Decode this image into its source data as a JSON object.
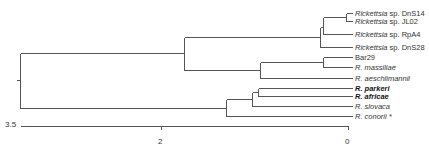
{
  "figure": {
    "type": "phylogenetic-tree",
    "line_color": "#555555",
    "leaves": [
      {
        "id": "DnS14",
        "genus": "Rickettsia",
        "rest": " sp. DnS14",
        "y": 13,
        "x_end": 352,
        "bold": false
      },
      {
        "id": "JL02",
        "genus": "Rickettsia",
        "rest": " sp. JL02",
        "y": 21,
        "x_end": 352,
        "bold": false
      },
      {
        "id": "RpA4",
        "genus": "Rickettsia",
        "rest": " sp. RpA4",
        "y": 34,
        "x_end": 352,
        "bold": false
      },
      {
        "id": "DnS28",
        "genus": "Rickettsia",
        "rest": " sp. DnS28",
        "y": 47,
        "x_end": 352,
        "bold": false
      },
      {
        "id": "Bar29",
        "genus": "",
        "rest": "Bar29",
        "y": 57,
        "x_end": 352,
        "bold": false
      },
      {
        "id": "massiliae",
        "genus": "R. massiliae",
        "rest": "",
        "y": 67,
        "x_end": 352,
        "bold": false
      },
      {
        "id": "aeschlimannii",
        "genus": "R. aeschlimannii",
        "rest": "",
        "y": 78,
        "x_end": 352,
        "bold": false
      },
      {
        "id": "parkeri",
        "genus": "R. parkeri",
        "rest": "",
        "y": 88,
        "x_end": 352,
        "bold": true
      },
      {
        "id": "africae",
        "genus": "R. africae",
        "rest": "",
        "y": 96,
        "x_end": 352,
        "bold": true
      },
      {
        "id": "slovaca",
        "genus": "R. slovaca",
        "rest": "",
        "y": 106,
        "x_end": 352,
        "bold": false
      },
      {
        "id": "conorii",
        "genus": "R. conorii",
        "rest": " *",
        "y": 116,
        "x_end": 352,
        "bold": false
      }
    ],
    "segments": [
      [
        16,
        80,
        20,
        80
      ],
      [
        20,
        53,
        20,
        108
      ],
      [
        20,
        53,
        184,
        53
      ],
      [
        20,
        108,
        226,
        108
      ],
      [
        184,
        37,
        184,
        70
      ],
      [
        184,
        37,
        320,
        37
      ],
      [
        184,
        70,
        260,
        70
      ],
      [
        320,
        27,
        320,
        47
      ],
      [
        320,
        27,
        323,
        27
      ],
      [
        320,
        47,
        352,
        47
      ],
      [
        323,
        17,
        323,
        34
      ],
      [
        323,
        17,
        346,
        17
      ],
      [
        323,
        34,
        352,
        34
      ],
      [
        346,
        13,
        346,
        21
      ],
      [
        346,
        13,
        352,
        13
      ],
      [
        346,
        21,
        352,
        21
      ],
      [
        260,
        62,
        260,
        78
      ],
      [
        260,
        62,
        323,
        62
      ],
      [
        260,
        78,
        352,
        78
      ],
      [
        323,
        57,
        323,
        67
      ],
      [
        323,
        57,
        352,
        57
      ],
      [
        323,
        67,
        352,
        67
      ],
      [
        226,
        99,
        226,
        116
      ],
      [
        226,
        99,
        252,
        99
      ],
      [
        226,
        116,
        352,
        116
      ],
      [
        252,
        92,
        252,
        106
      ],
      [
        252,
        92,
        258,
        92
      ],
      [
        252,
        106,
        352,
        106
      ],
      [
        258,
        88,
        258,
        96
      ],
      [
        258,
        88,
        352,
        88
      ],
      [
        258,
        96,
        352,
        96
      ]
    ],
    "scale_axis": {
      "y": 126,
      "x_start": 20,
      "x_end": 348,
      "ticks": [
        {
          "value": "3.5",
          "x": 20,
          "label_x": 6,
          "label_y": 121,
          "side": "left"
        },
        {
          "value": "2",
          "x": 161,
          "label_x": 159,
          "label_y": 139,
          "side": "below"
        },
        {
          "value": "0",
          "x": 348,
          "label_x": 346,
          "label_y": 139,
          "side": "below"
        }
      ]
    }
  },
  "labels": {
    "DnS14": "Rickettsia sp. DnS14",
    "JL02": "Rickettsia sp. JL02",
    "RpA4": "Rickettsia sp. RpA4",
    "DnS28": "Rickettsia sp. DnS28",
    "Bar29": "Bar29",
    "massiliae": "R. massiliae",
    "aeschlimannii": "R. aeschlimannii",
    "parkeri": "R. parkeri",
    "africae": "R. africae",
    "slovaca": "R. slovaca",
    "conorii": "R. conorii *",
    "axis_3_5": "3.5",
    "axis_2": "2",
    "axis_0": "0"
  }
}
